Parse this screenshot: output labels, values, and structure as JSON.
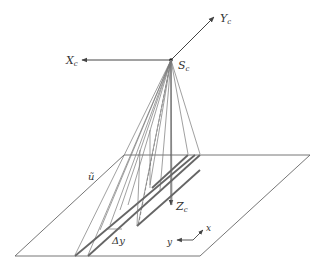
{
  "labels": {
    "xc": "X",
    "xc_sub": "c",
    "yc": "Y",
    "yc_sub": "c",
    "zc": "Z",
    "zc_sub": "c",
    "sc": "S",
    "sc_sub": "c",
    "u": "ũ",
    "delta_y": "Δy",
    "x": "x",
    "y": "y"
  },
  "colors": {
    "line": "#555555",
    "thick": "#666666",
    "text": "#333333"
  }
}
